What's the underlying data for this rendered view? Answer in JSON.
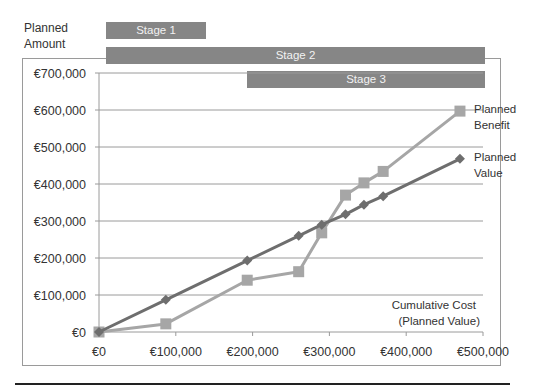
{
  "chart_data": {
    "type": "line",
    "title": "",
    "ylabel": "Planned Amount",
    "xlabel": "Cumulative Cost (Planned Value)",
    "xlim": [
      0,
      500000
    ],
    "ylim": [
      0,
      700000
    ],
    "x_ticks": [
      "€0",
      "€100,000",
      "€200,000",
      "€300,000",
      "€400,000",
      "€500,000"
    ],
    "y_ticks": [
      "€0",
      "€100,000",
      "€200,000",
      "€300,000",
      "€400,000",
      "€500,000",
      "€600,000",
      "€700,000"
    ],
    "grid": "horizontal",
    "x": [
      0,
      87000,
      193000,
      260000,
      290000,
      321000,
      345000,
      370000,
      470000
    ],
    "series": [
      {
        "name": "Planned Value",
        "label": [
          "Planned",
          "Value"
        ],
        "marker": "diamond",
        "color": "#6e6e6e",
        "values": [
          0,
          87000,
          193000,
          260000,
          290000,
          318000,
          344000,
          367000,
          468000
        ]
      },
      {
        "name": "Planned Benefit",
        "label": [
          "Planned",
          "Benefit"
        ],
        "marker": "square",
        "color": "#a6a6a6",
        "values": [
          0,
          22000,
          140000,
          163000,
          268000,
          370000,
          403000,
          434000,
          597000
        ]
      }
    ],
    "stages": [
      {
        "label": "Stage 1",
        "x_start": 20000,
        "x_end": 140000
      },
      {
        "label": "Stage 2",
        "x_start": 20000,
        "x_end": 500000
      },
      {
        "label": "Stage 3",
        "x_start": 193000,
        "x_end": 500000
      }
    ],
    "legend": "inline labels at line ends"
  },
  "labels": {
    "y_axis_title_line1": "Planned",
    "y_axis_title_line2": "Amount",
    "x_axis_title_line1": "Cumulative Cost",
    "x_axis_title_line2": "(Planned Value)",
    "stage1": "Stage 1",
    "stage2": "Stage 2",
    "stage3": "Stage 3"
  }
}
